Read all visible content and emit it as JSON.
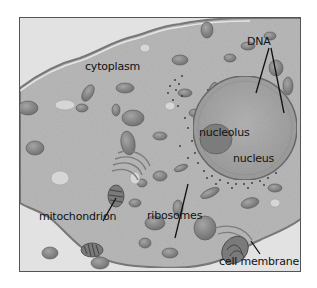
{
  "diagram": {
    "labels": {
      "cytoplasm": "cytoplasm",
      "dna": "DNA",
      "nucleolus": "nucleolus",
      "nucleus": "nucleus",
      "mitochondrion": "mitochondrion",
      "ribosomes": "ribosomes",
      "cell_membrane": "cell membrane"
    },
    "colors": {
      "background": "#ffffff",
      "outside_cell": "#e4e4e4",
      "cytoplasm": "#b8b8b8",
      "organelle": "#8c8c8c",
      "nucleus": "#a9a9a9",
      "nucleolus": "#7d7d7d",
      "leader_line": "#111111"
    }
  }
}
